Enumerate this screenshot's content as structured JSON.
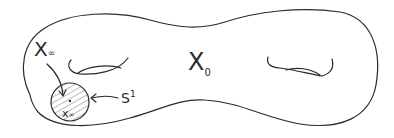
{
  "diagram": {
    "type": "hand-drawn genus-2 surface",
    "colors": {
      "ink": "#2a2a2a",
      "background": "#ffffff"
    },
    "labels": {
      "x_infinity_region": {
        "main": "X",
        "sub": "∞"
      },
      "x_zero_region": {
        "main": "X",
        "sub": "0"
      },
      "circle": {
        "main": "S",
        "sup": "1"
      },
      "point": {
        "main": "x",
        "sub": "∞"
      }
    },
    "elements": [
      "surface-outline",
      "left-handle-hole",
      "right-handle-hole",
      "hatched-disk",
      "arrow-x-infinity-to-disk",
      "arrow-s1-to-boundary"
    ]
  }
}
